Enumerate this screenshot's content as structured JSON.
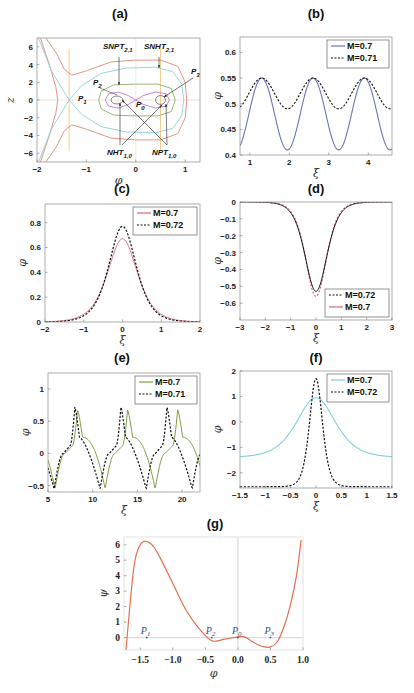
{
  "figure": {
    "panels": [
      "(a)",
      "(b)",
      "(c)",
      "(d)",
      "(e)",
      "(f)",
      "(g)"
    ]
  },
  "chart_data": [
    {
      "id": "a",
      "type": "line",
      "title": "(a)",
      "xlabel": "φ",
      "ylabel": "z",
      "xlim": [
        -2,
        1.3
      ],
      "ylim": [
        -7,
        7
      ],
      "xticks": [
        -2,
        -1,
        0,
        1
      ],
      "yticks": [
        6,
        4,
        2,
        0,
        -2,
        -4,
        -6
      ],
      "description": "Phase portrait with closed/open trajectories around fixed points",
      "fixed_points": [
        {
          "label": "P1",
          "phi": -1.35,
          "z": 0
        },
        {
          "label": "P2",
          "phi": -0.4,
          "z": 0
        },
        {
          "label": "P0",
          "phi": 0,
          "z": 0
        },
        {
          "label": "P3",
          "phi": 0.5,
          "z": 0
        }
      ],
      "annotations": [
        "SNPT2,1",
        "SNHT2,1",
        "NHT1,0",
        "NPT1,0",
        "P1",
        "P2",
        "P0",
        "P3"
      ],
      "grid": false,
      "colors": {
        "outer": "#e08a78",
        "separatrix": "#8fd0d8",
        "inner": "#8ab06a",
        "loops": "#c07ad0",
        "guides": "#f0c070"
      }
    },
    {
      "id": "b",
      "type": "line",
      "title": "(b)",
      "xlabel": "ξ",
      "ylabel": "φ",
      "xlim": [
        0.75,
        4.6
      ],
      "ylim": [
        0.4,
        0.63
      ],
      "xticks": [
        1,
        2,
        3,
        4
      ],
      "yticks": [
        0.4,
        0.45,
        0.5,
        0.55,
        0.6
      ],
      "legend": {
        "position": "upper right",
        "entries": [
          "M=0.7",
          "M=0.71"
        ]
      },
      "series": [
        {
          "name": "M=0.7",
          "style": "solid",
          "color": "#6a76b8",
          "min": 0.41,
          "max": 0.55,
          "period": 1.3,
          "peak_x": [
            1.3,
            2.6,
            3.9
          ]
        },
        {
          "name": "M=0.71",
          "style": "dashed",
          "color": "#111111",
          "min": 0.49,
          "max": 0.55,
          "period": 1.3,
          "peak_x": [
            1.3,
            2.6,
            3.9
          ]
        }
      ]
    },
    {
      "id": "c",
      "type": "line",
      "title": "(c)",
      "xlabel": "ξ",
      "ylabel": "φ",
      "xlim": [
        -2,
        2
      ],
      "ylim": [
        0,
        0.95
      ],
      "xticks": [
        -2,
        -1,
        0,
        1,
        2
      ],
      "yticks": [
        0,
        0.2,
        0.4,
        0.6,
        0.8
      ],
      "legend": {
        "position": "upper right",
        "entries": [
          "M=0.7",
          "M=0.72"
        ]
      },
      "series": [
        {
          "name": "M=0.7",
          "style": "solid",
          "color": "#d86a78",
          "peak": 0.67,
          "center": 0
        },
        {
          "name": "M=0.72",
          "style": "dashed",
          "color": "#111111",
          "peak": 0.77,
          "center": 0
        }
      ]
    },
    {
      "id": "d",
      "type": "line",
      "title": "(d)",
      "xlabel": "ξ",
      "ylabel": "φ",
      "xlim": [
        -3,
        3
      ],
      "ylim": [
        -0.7,
        0
      ],
      "xticks": [
        -3,
        -2,
        -1,
        0,
        1,
        2,
        3
      ],
      "yticks": [
        0,
        -0.1,
        -0.2,
        -0.3,
        -0.4,
        -0.5,
        -0.6
      ],
      "legend": {
        "position": "lower right",
        "entries": [
          "M=0.72",
          "M=0.7"
        ]
      },
      "series": [
        {
          "name": "M=0.72",
          "style": "dashed",
          "color": "#111111",
          "trough": -0.53,
          "center": 0
        },
        {
          "name": "M=0.7",
          "style": "solid",
          "color": "#d86a78",
          "trough": -0.56,
          "center": 0
        }
      ]
    },
    {
      "id": "e",
      "type": "line",
      "title": "(e)",
      "xlabel": "ξ",
      "ylabel": "φ",
      "xlim": [
        5,
        22
      ],
      "ylim": [
        -0.6,
        1.25
      ],
      "xticks": [
        5,
        10,
        15,
        20
      ],
      "yticks": [
        -0.5,
        0,
        0.5,
        1
      ],
      "legend": {
        "position": "upper right",
        "entries": [
          "M=0.7",
          "M=0.71"
        ]
      },
      "series": [
        {
          "name": "M=0.7",
          "style": "solid",
          "color": "#7aa040",
          "min": -0.55,
          "max": 0.68,
          "peaks_x": [
            8.3,
            14.0,
            19.5
          ]
        },
        {
          "name": "M=0.71",
          "style": "dashed",
          "color": "#111111",
          "min": -0.55,
          "max": 0.72,
          "peaks_x": [
            8.0,
            13.5,
            18.3
          ]
        }
      ]
    },
    {
      "id": "f",
      "type": "line",
      "title": "(f)",
      "xlabel": "ξ",
      "ylabel": "φ",
      "xlim": [
        -1.5,
        1.5
      ],
      "ylim": [
        -2.6,
        2
      ],
      "xticks": [
        -1.5,
        -1,
        -0.5,
        0,
        0.5,
        1,
        1.5
      ],
      "yticks": [
        2,
        1,
        0,
        -1,
        -2
      ],
      "legend": {
        "position": "upper right",
        "entries": [
          "M=0.7",
          "M=0.72"
        ]
      },
      "series": [
        {
          "name": "M=0.7",
          "style": "solid",
          "color": "#7fd0d8",
          "peak": 0.95,
          "baseline": -1.4
        },
        {
          "name": "M=0.72",
          "style": "dashed",
          "color": "#111111",
          "peak": 1.7,
          "baseline": -2.55
        }
      ]
    },
    {
      "id": "g",
      "type": "line",
      "title": "(g)",
      "xlabel": "φ",
      "ylabel": "ψ",
      "xlim": [
        -1.75,
        1.0
      ],
      "ylim": [
        -0.8,
        6.5
      ],
      "xticks": [
        -1.5,
        -1.0,
        -0.5,
        0.0,
        0.5,
        1.0
      ],
      "yticks": [
        0,
        1,
        2,
        3,
        4,
        5,
        6
      ],
      "grid": false,
      "series": [
        {
          "name": "psi",
          "style": "solid",
          "color": "#e07050",
          "x": [
            -1.72,
            -1.6,
            -1.5,
            -1.4,
            -1.3,
            -1.2,
            -1.0,
            -0.8,
            -0.6,
            -0.4,
            -0.2,
            0.0,
            0.1,
            0.2,
            0.3,
            0.4,
            0.5,
            0.6,
            0.7,
            0.8,
            0.9,
            0.97
          ],
          "y": [
            -0.8,
            4.5,
            6.0,
            6.2,
            5.9,
            5.2,
            3.5,
            1.8,
            0.6,
            -0.2,
            -0.1,
            0.05,
            0.05,
            -0.2,
            -0.45,
            -0.6,
            -0.6,
            -0.3,
            0.6,
            2.0,
            4.0,
            6.3
          ]
        }
      ],
      "points": [
        {
          "label": "P1",
          "x": -1.4
        },
        {
          "label": "P2",
          "x": -0.4
        },
        {
          "label": "P0",
          "x": 0.0
        },
        {
          "label": "P3",
          "x": 0.5
        }
      ]
    }
  ]
}
